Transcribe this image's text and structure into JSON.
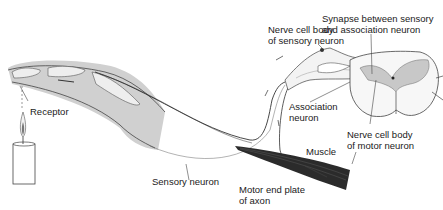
{
  "diagram": {
    "type": "reflex-arc-illustration",
    "labels": {
      "receptor": "Receptor",
      "sensory_neuron": "Sensory neuron",
      "nerve_cell_body_sensory_l1": "Nerve cell body",
      "nerve_cell_body_sensory_l2": "of sensory neuron",
      "synapse_l1": "Synapse between sensory",
      "synapse_l2": "and association neuron",
      "association_l1": "Association",
      "association_l2": "neuron",
      "motor_body_l1": "Nerve cell body",
      "motor_body_l2": "of motor neuron",
      "muscle": "Muscle",
      "motor_end_l1": "Motor end plate",
      "motor_end_l2": "of axon"
    },
    "colors": {
      "line": "#2a2a2a",
      "shade": "#c8c8c8",
      "light_shade": "#e6e6e6",
      "muscle": "#2b2b2b"
    }
  }
}
